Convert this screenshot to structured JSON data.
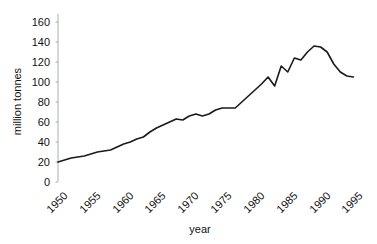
{
  "chart_data": {
    "type": "line",
    "title": "",
    "xlabel": "year",
    "ylabel": "million tonnes",
    "xlim": [
      1950,
      1996
    ],
    "ylim": [
      0,
      168
    ],
    "grid": false,
    "legend": null,
    "line_color": "#1a1a1a",
    "background_color": "#ffffff",
    "x_tick_labels": [
      "1950",
      "1955",
      "1960",
      "1965",
      "1970",
      "1975",
      "1980",
      "1985",
      "1990",
      "1995"
    ],
    "x_ticks": [
      1950,
      1955,
      1960,
      1965,
      1970,
      1975,
      1980,
      1985,
      1990,
      1995
    ],
    "y_tick_labels": [
      "0",
      "20",
      "40",
      "60",
      "80",
      "100",
      "120",
      "140",
      "160"
    ],
    "y_ticks": [
      0,
      20,
      40,
      60,
      80,
      100,
      120,
      140,
      160
    ],
    "x": [
      1950,
      1951,
      1952,
      1953,
      1954,
      1955,
      1956,
      1957,
      1958,
      1959,
      1960,
      1961,
      1962,
      1963,
      1964,
      1965,
      1966,
      1967,
      1968,
      1969,
      1970,
      1971,
      1972,
      1973,
      1974,
      1975,
      1976,
      1977,
      1978,
      1979,
      1980,
      1981,
      1982,
      1983,
      1984,
      1985,
      1986,
      1987,
      1988,
      1989,
      1990,
      1991,
      1992,
      1993,
      1994,
      1995
    ],
    "values": [
      20,
      22,
      24,
      25,
      26,
      28,
      30,
      31,
      32,
      35,
      38,
      40,
      43,
      45,
      50,
      54,
      57,
      60,
      63,
      62,
      66,
      68,
      66,
      68,
      72,
      74,
      74,
      74,
      80,
      86,
      92,
      98,
      105,
      96,
      116,
      110,
      124,
      122,
      130,
      136,
      135,
      130,
      118,
      110,
      106,
      105
    ],
    "annotations": []
  },
  "axis_labels": {
    "x": "year",
    "y": "million tonnes"
  }
}
